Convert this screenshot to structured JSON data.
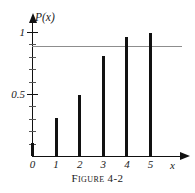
{
  "figure": {
    "caption": "Figure 4-2",
    "background_color": "#ffffff",
    "ink_color": "#111111",
    "gridline_color": "#8d8d8d"
  },
  "axes": {
    "y_title": "P(x)",
    "x_title": "x",
    "y_major_ticks": [
      {
        "value": 0.5,
        "label": "0.5"
      },
      {
        "value": 1,
        "label": "1"
      }
    ],
    "y_minor_tick_values": [
      0.1,
      0.2,
      0.3,
      0.4,
      0.6,
      0.7,
      0.8,
      0.9
    ],
    "x_ticks": [
      {
        "value": 0,
        "label": "0"
      },
      {
        "value": 1,
        "label": "1"
      },
      {
        "value": 2,
        "label": "2"
      },
      {
        "value": 3,
        "label": "3"
      },
      {
        "value": 4,
        "label": "4"
      },
      {
        "value": 5,
        "label": "5"
      }
    ],
    "y_arrow": "arrow-up-icon",
    "x_arrow": "arrow-right-icon"
  },
  "chart_data": {
    "type": "bar",
    "title": "Figure 4-2",
    "xlabel": "x",
    "ylabel": "P(x)",
    "categories": [
      "0",
      "1",
      "2",
      "3",
      "4",
      "5"
    ],
    "values": [
      0.11,
      0.31,
      0.5,
      0.81,
      0.96,
      1.0
    ],
    "xlim": [
      0,
      5
    ],
    "ylim": [
      0,
      1
    ],
    "grid": false,
    "legend": "none",
    "annotations": [
      {
        "name": "threshold-line",
        "type": "horizontal-line",
        "value": 0.89,
        "color": "#8d8d8d"
      }
    ]
  }
}
